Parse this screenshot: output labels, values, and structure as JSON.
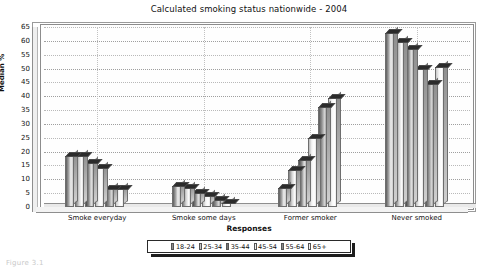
{
  "chart_data": {
    "type": "bar",
    "title": "Calculated smoking status nationwide - 2004",
    "xlabel": "Responses",
    "ylabel": "Median %",
    "categories": [
      "Smoke everyday",
      "Smoke some days",
      "Former smoker",
      "Never smoked"
    ],
    "ylim": [
      0,
      65
    ],
    "yticks": [
      0,
      5,
      10,
      15,
      20,
      25,
      30,
      35,
      40,
      45,
      50,
      55,
      60,
      65
    ],
    "grid": true,
    "legend_position": "bottom",
    "style": "3d-bars-greyscale",
    "series": [
      {
        "name": "18-24",
        "values": [
          18.5,
          7.5,
          7.0,
          63.0
        ]
      },
      {
        "name": "25-34",
        "values": [
          18.5,
          7.0,
          13.5,
          59.5
        ]
      },
      {
        "name": "35-44",
        "values": [
          16.0,
          5.0,
          17.0,
          57.0
        ]
      },
      {
        "name": "45-54",
        "values": [
          14.0,
          4.0,
          25.0,
          50.0
        ]
      },
      {
        "name": "55-64",
        "values": [
          6.5,
          2.5,
          36.0,
          44.5
        ]
      },
      {
        "name": "65+",
        "values": [
          6.5,
          1.5,
          39.5,
          50.5
        ]
      }
    ]
  },
  "figure": {
    "caption": "Figure 3.1"
  }
}
